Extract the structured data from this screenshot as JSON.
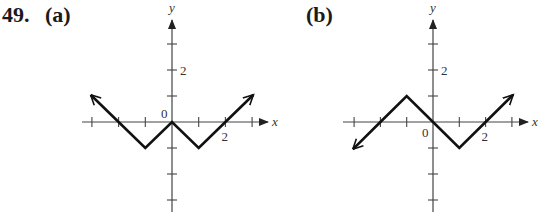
{
  "problem": {
    "number": "49.",
    "parts": [
      "(a)",
      "(b)"
    ]
  },
  "chart_data": [
    {
      "type": "line",
      "title": "(a)",
      "xlabel": "x",
      "ylabel": "y",
      "xlim": [
        -3.5,
        3.5
      ],
      "ylim": [
        -3.5,
        3.5
      ],
      "xticks": [
        -3,
        -2,
        -1,
        0,
        1,
        2,
        3
      ],
      "yticks": [
        -3,
        -2,
        -1,
        1,
        2,
        3
      ],
      "labeled_ticks": {
        "x": [
          "2"
        ],
        "y": [
          "2"
        ],
        "origin": "0"
      },
      "points": [
        [
          -3,
          1
        ],
        [
          -2,
          0
        ],
        [
          -1,
          -1
        ],
        [
          0,
          0
        ],
        [
          1,
          -1
        ],
        [
          2,
          0
        ],
        [
          3,
          1
        ]
      ],
      "arrows": [
        "left-end",
        "right-end"
      ],
      "grid": false
    },
    {
      "type": "line",
      "title": "(b)",
      "xlabel": "x",
      "ylabel": "y",
      "xlim": [
        -3.5,
        3.5
      ],
      "ylim": [
        -3.5,
        3.5
      ],
      "xticks": [
        -3,
        -2,
        -1,
        0,
        1,
        2,
        3
      ],
      "yticks": [
        -3,
        -2,
        -1,
        1,
        2,
        3
      ],
      "labeled_ticks": {
        "x": [
          "2"
        ],
        "y": [
          "2"
        ],
        "origin": "0"
      },
      "points": [
        [
          -3,
          -1
        ],
        [
          -2,
          0
        ],
        [
          -1,
          1
        ],
        [
          0,
          0
        ],
        [
          1,
          -1
        ],
        [
          2,
          0
        ],
        [
          3,
          1
        ]
      ],
      "arrows": [
        "left-end",
        "right-end"
      ],
      "grid": false
    }
  ]
}
